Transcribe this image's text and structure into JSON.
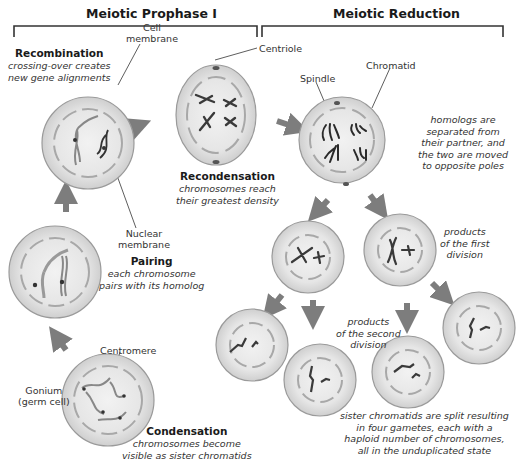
{
  "headers": {
    "prophase": "Meiotic Prophase I",
    "reduction": "Meiotic Reduction"
  },
  "stages": {
    "recombination": {
      "title": "Recombination",
      "desc1": "crossing-over creates",
      "desc2": "new gene alignments"
    },
    "recondensation": {
      "title": "Recondensation",
      "desc1": "chromosomes reach",
      "desc2": "their greatest density"
    },
    "pairing": {
      "title": "Pairing",
      "desc1": "each chromosome",
      "desc2": "pairs with its homolog"
    },
    "condensation": {
      "title": "Condensation",
      "desc1": "chromosomes become",
      "desc2": "visible as sister chromatids"
    },
    "separation": {
      "desc1": "homologs are",
      "desc2": "separated from",
      "desc3": "their partner, and",
      "desc4": "the two are moved",
      "desc5": "to opposite poles"
    },
    "first_division": {
      "desc1": "products",
      "desc2": "of the first",
      "desc3": "division"
    },
    "second_division": {
      "desc1": "products",
      "desc2": "of the second",
      "desc3": "division"
    },
    "gametes": {
      "desc1": "sister chromatids are split resulting",
      "desc2": "in four gametes, each with a",
      "desc3": "haploid number of chromosomes,",
      "desc4": "all in the unduplicated state"
    }
  },
  "labels": {
    "cell_membrane_1": "Cell",
    "cell_membrane_2": "membrane",
    "centriole": "Centriole",
    "spindle": "Spindle",
    "chromatid": "Chromatid",
    "nuclear_membrane_1": "Nuclear",
    "nuclear_membrane_2": "membrane",
    "centromere": "Centromere",
    "gonium_1": "Gonium",
    "gonium_2": "(germ cell)"
  },
  "colors": {
    "cell_fill": "#dcdcdc",
    "cell_inner": "#e9e9e9",
    "cell_stroke": "#9a9a9a",
    "nuclear_dash": "#a8a8a8",
    "chromosome": "#3a3a3a",
    "arrow": "#7d7d7d",
    "bracket": "#333333"
  }
}
